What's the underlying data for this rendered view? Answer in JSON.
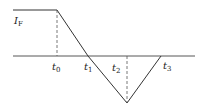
{
  "diagram": {
    "type": "piecewise-linear waveform (current vs time)",
    "colors": {
      "line": "#333333",
      "dash": "#555555",
      "background": "#ffffff"
    },
    "labels": {
      "current": {
        "main": "I",
        "sub": "F"
      },
      "t0": {
        "main": "t",
        "sub": "0"
      },
      "t1": {
        "main": "t",
        "sub": "1"
      },
      "t2": {
        "main": "t",
        "sub": "2"
      },
      "t3": {
        "main": "t",
        "sub": "3"
      }
    },
    "points": {
      "plateau_start": [
        13,
        10
      ],
      "t0_corner": [
        57,
        10
      ],
      "t1_zero_crossing": [
        88,
        56
      ],
      "t2_minimum": [
        127,
        103
      ],
      "t3_zero_crossing": [
        161,
        56
      ],
      "axis_start": [
        13,
        56
      ],
      "axis_end": [
        195,
        56
      ]
    }
  }
}
